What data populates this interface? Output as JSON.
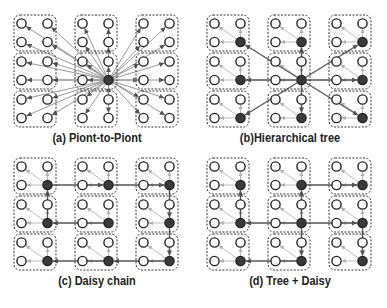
{
  "figure": {
    "panels": [
      {
        "id": "a",
        "caption": "(a) Piont-to-Piont",
        "topology": "point-to-point",
        "hub": {
          "row": 1,
          "col": 1,
          "node": "br"
        },
        "filled_nodes": "hub-only"
      },
      {
        "id": "b",
        "caption": "(b)Hierarchical tree",
        "topology": "hierarchical-tree",
        "hub": {
          "row": 1,
          "col": 1,
          "node": "br"
        },
        "filled_nodes": "bottom-right-of-each-group"
      },
      {
        "id": "c",
        "caption": "(c) Daisy chain",
        "topology": "daisy-chain",
        "filled_nodes": "bottom-right-of-each-group",
        "links": [
          [
            [
              0,
              0
            ],
            [
              0,
              1
            ]
          ],
          [
            [
              0,
              1
            ],
            [
              0,
              2
            ]
          ],
          [
            [
              0,
              2
            ],
            [
              1,
              2
            ]
          ],
          [
            [
              1,
              2
            ],
            [
              2,
              2
            ]
          ],
          [
            [
              2,
              2
            ],
            [
              2,
              1
            ]
          ],
          [
            [
              2,
              1
            ],
            [
              2,
              0
            ]
          ],
          [
            [
              1,
              1
            ],
            [
              1,
              0
            ]
          ],
          [
            [
              1,
              0
            ],
            [
              0,
              0
            ]
          ]
        ]
      },
      {
        "id": "d",
        "caption": "(d) Tree + Daisy",
        "topology": "tree-plus-daisy",
        "filled_nodes": "bottom-right-of-each-group",
        "links": [
          [
            [
              1,
              1
            ],
            [
              0,
              1
            ]
          ],
          [
            [
              1,
              1
            ],
            [
              2,
              1
            ]
          ],
          [
            [
              1,
              1
            ],
            [
              1,
              0
            ]
          ],
          [
            [
              1,
              1
            ],
            [
              1,
              2
            ]
          ],
          [
            [
              0,
              1
            ],
            [
              0,
              2
            ]
          ],
          [
            [
              1,
              0
            ],
            [
              0,
              0
            ]
          ],
          [
            [
              1,
              2
            ],
            [
              2,
              2
            ]
          ],
          [
            [
              2,
              1
            ],
            [
              2,
              0
            ]
          ]
        ]
      }
    ],
    "grid": {
      "group_rows": 3,
      "group_cols": 3,
      "nodes_per_group": 4
    },
    "colors": {
      "node_stroke": "#222222",
      "node_fill_active": "#3a3a3a",
      "group_border": "#333333",
      "main_link": "#555555",
      "intra_link": "#b5b5b5"
    }
  }
}
